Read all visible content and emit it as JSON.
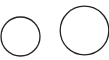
{
  "canvas": {
    "width": 109,
    "height": 60,
    "background": "#ffffff"
  },
  "shapes": [
    {
      "type": "circle",
      "name": "small-circle",
      "cx": 20.5,
      "cy": 36.5,
      "r": 19.5,
      "stroke": "#222222",
      "stroke_width": 1.3,
      "fill": "none"
    },
    {
      "type": "circle",
      "name": "large-circle",
      "cx": 84.5,
      "cy": 30.5,
      "r": 24.3,
      "stroke": "#222222",
      "stroke_width": 1.3,
      "fill": "none"
    }
  ]
}
